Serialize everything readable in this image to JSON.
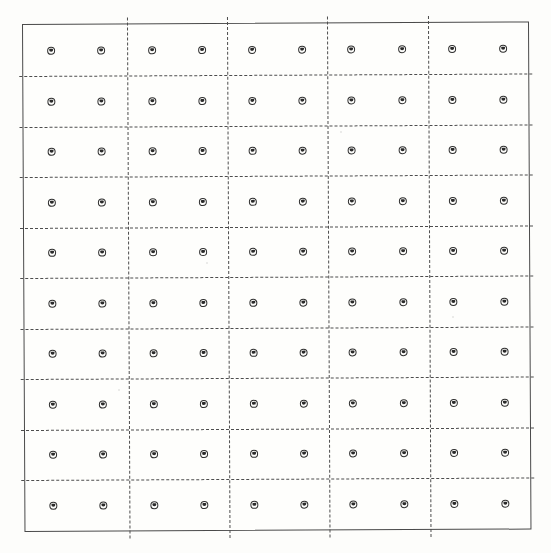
{
  "figure": {
    "kind": "grid-layout-diagram",
    "medium": "scanned line drawing",
    "title_text": "",
    "caption_text": ""
  },
  "canvas": {
    "width": 551,
    "height": 553,
    "page_color": "#fdfdfb"
  },
  "frame": {
    "type": "rectangle",
    "stroke": "solid",
    "stroke_color": "#4a4a4a",
    "stroke_width": 1.15,
    "x": 22,
    "y": 24,
    "width": 507,
    "height": 508,
    "rotation_deg": -0.28
  },
  "grid": {
    "rows": 10,
    "columns": 10,
    "total_markers": 100,
    "columns_per_bay": 2,
    "bays": 5,
    "marker": {
      "shape": "small-circle-with-inner-mark",
      "diameter_px": 8,
      "stroke_color": "#2e2e2e",
      "fill_color": "#fdfdfb"
    },
    "divider_style": {
      "stroke": "dashed",
      "stroke_color": "#4d4d4d",
      "stroke_width": 1.1,
      "dash_length_px": 6,
      "dash_gap_px": 4
    },
    "marker_x": [
      29,
      79,
      130,
      180,
      230,
      280,
      329,
      380,
      430,
      481
    ],
    "marker_y": [
      27,
      78,
      128,
      179,
      229,
      280,
      330,
      381,
      431,
      482
    ],
    "horizontal_divider_y": [
      52,
      103,
      153,
      204,
      254,
      305,
      355,
      406,
      456
    ],
    "vertical_divider_x": [
      105,
      205,
      305,
      406
    ],
    "row_labels": [
      "1",
      "2",
      "3",
      "4",
      "5",
      "6",
      "7",
      "8",
      "9",
      "10"
    ],
    "column_labels": [
      "1",
      "2",
      "3",
      "4",
      "5",
      "6",
      "7",
      "8",
      "9",
      "10"
    ],
    "bay_labels": [
      "A",
      "B",
      "C",
      "D",
      "E"
    ]
  },
  "specks": [
    {
      "x": 118,
      "y": 389
    },
    {
      "x": 206,
      "y": 262
    },
    {
      "x": 340,
      "y": 131
    },
    {
      "x": 452,
      "y": 316
    }
  ]
}
